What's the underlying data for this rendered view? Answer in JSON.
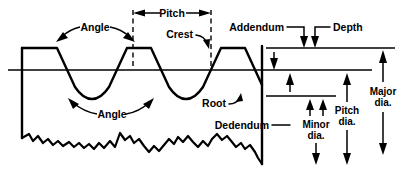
{
  "diagram": {
    "type": "technical-line-drawing",
    "background_color": "#ffffff",
    "line_color": "#000000",
    "labels": {
      "pitch": "Pitch",
      "angle_top": "Angle",
      "angle_bottom": "Angle",
      "crest": "Crest",
      "root": "Root",
      "addendum": "Addendum",
      "depth": "Depth",
      "dedendum": "Dedendum",
      "minor_dia_line1": "Minor",
      "minor_dia_line2": "dia.",
      "pitch_dia_line1": "Pitch",
      "pitch_dia_line2": "dia.",
      "major_dia_line1": "Major",
      "major_dia_line2": "dia."
    },
    "geometry": {
      "crest_y": 48,
      "pitch_line_y": 70,
      "root_y": 96,
      "left_edge_x": 22,
      "right_edge_x": 262,
      "pitch_start_x": 133,
      "pitch_end_x": 211,
      "minor_dia_x": 310,
      "pitch_dia_x": 344,
      "major_dia_x": 382
    }
  }
}
